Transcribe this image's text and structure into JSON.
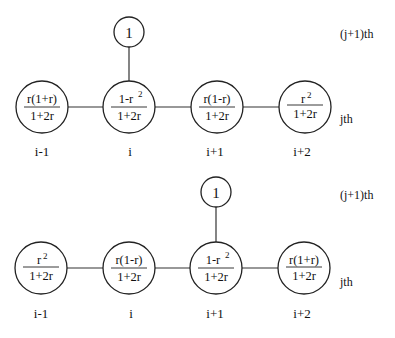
{
  "diagrams": [
    {
      "name": "stencil-top",
      "top_node": {
        "label": "1",
        "above_index": 1
      },
      "row_labels": {
        "upper": "(j+1)th",
        "lower": "jth"
      },
      "nodes": [
        {
          "index": "i-1",
          "numerator": "r(1+r)",
          "numerator_sup": "",
          "denominator": "1+2r"
        },
        {
          "index": "i",
          "numerator": "1-r",
          "numerator_sup": "2",
          "denominator": "1+2r"
        },
        {
          "index": "i+1",
          "numerator": "r(1-r)",
          "numerator_sup": "",
          "denominator": "1+2r"
        },
        {
          "index": "i+2",
          "numerator": "r",
          "numerator_sup": "2",
          "denominator": "1+2r"
        }
      ]
    },
    {
      "name": "stencil-bottom",
      "top_node": {
        "label": "1",
        "above_index": 2
      },
      "row_labels": {
        "upper": "(j+1)th",
        "lower": "jth"
      },
      "nodes": [
        {
          "index": "i-1",
          "numerator": "r",
          "numerator_sup": "2",
          "denominator": "1+2r"
        },
        {
          "index": "i",
          "numerator": "r(1-r)",
          "numerator_sup": "",
          "denominator": "1+2r"
        },
        {
          "index": "i+1",
          "numerator": "1-r",
          "numerator_sup": "2",
          "denominator": "1+2r"
        },
        {
          "index": "i+2",
          "numerator": "r(1+r)",
          "numerator_sup": "",
          "denominator": "1+2r"
        }
      ]
    }
  ]
}
